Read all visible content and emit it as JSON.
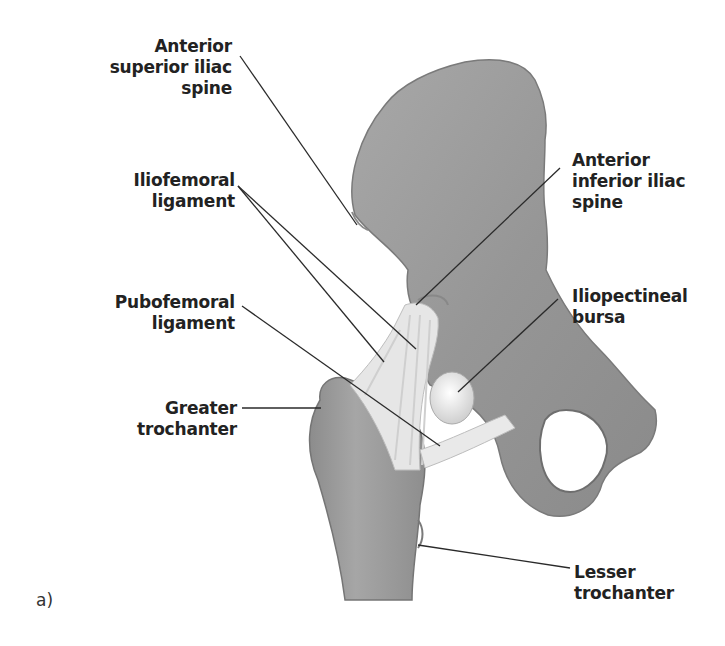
{
  "figure": {
    "panel_label": "a)",
    "colors": {
      "bone": "#9a9a9a",
      "bone_dark": "#7c7c7c",
      "bone_light": "#b4b4b4",
      "ligament": "#e8e8e8",
      "bursa": "#f0f0f0",
      "leader_line": "#2a2a2a",
      "text": "#222222"
    }
  },
  "labels": [
    {
      "id": "anterior-superior-iliac-spine",
      "lines": [
        "Anterior",
        "superior iliac",
        "spine"
      ]
    },
    {
      "id": "iliofemoral-ligament",
      "lines": [
        "Iliofemoral",
        "ligament"
      ]
    },
    {
      "id": "pubofemoral-ligament",
      "lines": [
        "Pubofemoral",
        "ligament"
      ]
    },
    {
      "id": "greater-trochanter",
      "lines": [
        "Greater",
        "trochanter"
      ]
    },
    {
      "id": "anterior-inferior-iliac-spine",
      "lines": [
        "Anterior",
        "inferior iliac",
        "spine"
      ]
    },
    {
      "id": "iliopectineal-bursa",
      "lines": [
        "Iliopectineal",
        "bursa"
      ]
    },
    {
      "id": "lesser-trochanter",
      "lines": [
        "Lesser",
        "trochanter"
      ]
    }
  ]
}
